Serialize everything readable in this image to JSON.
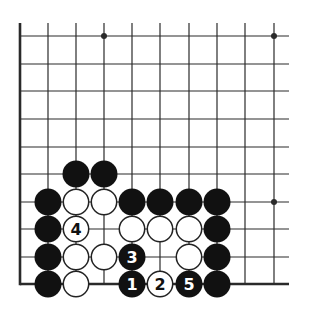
{
  "diagram": {
    "type": "go-board-corner",
    "grid": {
      "columns_x": [
        20,
        48,
        76,
        104,
        132,
        160,
        189,
        217,
        245,
        274
      ],
      "rows_y": [
        36,
        64,
        91,
        119,
        147,
        174,
        202,
        229,
        257,
        284
      ],
      "line_color": "#2a2a2a",
      "edge_left": true,
      "edge_bottom": true,
      "top_extend_to": 23,
      "right_extend_to": 289
    },
    "star_points": [
      {
        "col": 3,
        "row": 0
      },
      {
        "col": 9,
        "row": 0
      },
      {
        "col": 9,
        "row": 6
      }
    ],
    "stone_radius": 13.5,
    "colors": {
      "black": "#111111",
      "white_fill": "#ffffff",
      "white_outline": "#222222"
    },
    "stones": [
      {
        "color": "black",
        "col": 2,
        "row": 5,
        "label": ""
      },
      {
        "color": "black",
        "col": 3,
        "row": 5,
        "label": ""
      },
      {
        "color": "black",
        "col": 1,
        "row": 6,
        "label": ""
      },
      {
        "color": "white",
        "col": 2,
        "row": 6,
        "label": ""
      },
      {
        "color": "white",
        "col": 3,
        "row": 6,
        "label": ""
      },
      {
        "color": "black",
        "col": 4,
        "row": 6,
        "label": ""
      },
      {
        "color": "black",
        "col": 5,
        "row": 6,
        "label": ""
      },
      {
        "color": "black",
        "col": 6,
        "row": 6,
        "label": ""
      },
      {
        "color": "black",
        "col": 7,
        "row": 6,
        "label": ""
      },
      {
        "color": "black",
        "col": 1,
        "row": 7,
        "label": ""
      },
      {
        "color": "white",
        "col": 2,
        "row": 7,
        "label": "4"
      },
      {
        "color": "white",
        "col": 4,
        "row": 7,
        "label": ""
      },
      {
        "color": "white",
        "col": 5,
        "row": 7,
        "label": ""
      },
      {
        "color": "white",
        "col": 6,
        "row": 7,
        "label": ""
      },
      {
        "color": "black",
        "col": 7,
        "row": 7,
        "label": ""
      },
      {
        "color": "black",
        "col": 1,
        "row": 8,
        "label": ""
      },
      {
        "color": "white",
        "col": 2,
        "row": 8,
        "label": ""
      },
      {
        "color": "white",
        "col": 3,
        "row": 8,
        "label": ""
      },
      {
        "color": "black",
        "col": 4,
        "row": 8,
        "label": "3"
      },
      {
        "color": "white",
        "col": 6,
        "row": 8,
        "label": ""
      },
      {
        "color": "black",
        "col": 7,
        "row": 8,
        "label": ""
      },
      {
        "color": "black",
        "col": 1,
        "row": 9,
        "label": ""
      },
      {
        "color": "white",
        "col": 2,
        "row": 9,
        "label": ""
      },
      {
        "color": "black",
        "col": 4,
        "row": 9,
        "label": "1"
      },
      {
        "color": "white",
        "col": 5,
        "row": 9,
        "label": "2"
      },
      {
        "color": "black",
        "col": 6,
        "row": 9,
        "label": "5"
      },
      {
        "color": "black",
        "col": 7,
        "row": 9,
        "label": ""
      }
    ],
    "move_sequence": [
      {
        "move": 1,
        "color": "black",
        "col": 4,
        "row": 9
      },
      {
        "move": 2,
        "color": "white",
        "col": 5,
        "row": 9
      },
      {
        "move": 3,
        "color": "black",
        "col": 4,
        "row": 8
      },
      {
        "move": 4,
        "color": "white",
        "col": 2,
        "row": 7
      },
      {
        "move": 5,
        "color": "black",
        "col": 6,
        "row": 9
      }
    ]
  }
}
